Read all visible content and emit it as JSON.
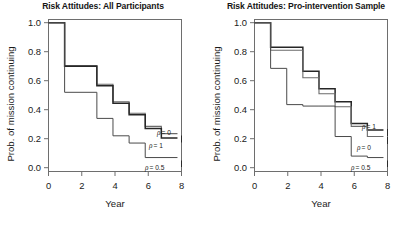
{
  "figure": {
    "width": 412,
    "height": 226,
    "background": "#ffffff",
    "line_color_dark": "#262626",
    "line_color_mid": "#6b6b6b",
    "line_color_light": "#9a9a9a",
    "axis_color": "#6e6e6e"
  },
  "panels": [
    {
      "id": "all-participants",
      "title": "Risk Attitudes: All Participants",
      "xlabel": "Year",
      "ylabel": "Prob. of mission continuing",
      "xticks": [
        "0",
        "2",
        "4",
        "6",
        "8"
      ],
      "yticks": [
        "0.0",
        "0.2",
        "0.4",
        "0.6",
        "0.8",
        "1.0"
      ],
      "curve_labels": [
        {
          "rho": "ρ",
          "eq": " = 0",
          "full": "ρ = 0"
        },
        {
          "rho": "ρ",
          "eq": " = 1",
          "full": "ρ = 1"
        },
        {
          "rho": "ρ",
          "eq": " = 0.5",
          "full": "ρ = 0.5"
        }
      ]
    },
    {
      "id": "pro-intervention-sample",
      "title": "Risk Attitudes: Pro-intervention Sample",
      "xlabel": "Year",
      "ylabel": "Prob. of mission continuing",
      "xticks": [
        "0",
        "2",
        "4",
        "6",
        "8"
      ],
      "yticks": [
        "0.0",
        "0.2",
        "0.4",
        "0.6",
        "0.8",
        "1.0"
      ],
      "curve_labels": [
        {
          "rho": "ρ",
          "eq": " = 1",
          "full": "ρ = 1"
        },
        {
          "rho": "ρ",
          "eq": " = 0",
          "full": "ρ = 0"
        },
        {
          "rho": "ρ",
          "eq": " = 0.5",
          "full": "ρ = 0.5"
        }
      ]
    }
  ],
  "chart_data": [
    {
      "type": "line",
      "subtype": "step-survival",
      "title": "Risk Attitudes: All Participants",
      "xlabel": "Year",
      "ylabel": "Prob. of mission continuing",
      "xlim": [
        0,
        8.25
      ],
      "ylim": [
        0,
        1.02
      ],
      "xticks": [
        0,
        2,
        4,
        6,
        8
      ],
      "yticks": [
        0.0,
        0.2,
        0.4,
        0.6,
        0.8,
        1.0
      ],
      "grid": false,
      "legend": "inline-right-labels",
      "series": [
        {
          "name": "ρ = 0",
          "label": "ρ = 0",
          "color": "#6b6b6b",
          "width": 1.1,
          "x": [
            0,
            1,
            1,
            3,
            3,
            4,
            4,
            5,
            5,
            6,
            6,
            7,
            7,
            8
          ],
          "y": [
            1.0,
            1.0,
            0.705,
            0.705,
            0.575,
            0.575,
            0.455,
            0.455,
            0.375,
            0.375,
            0.285,
            0.285,
            0.235,
            0.235
          ],
          "steps": [
            {
              "year": 0,
              "prob": 1.0
            },
            {
              "year": 1,
              "prob": 0.705
            },
            {
              "year": 3,
              "prob": 0.575
            },
            {
              "year": 4,
              "prob": 0.455
            },
            {
              "year": 5,
              "prob": 0.375
            },
            {
              "year": 6,
              "prob": 0.285
            },
            {
              "year": 7,
              "prob": 0.235
            }
          ]
        },
        {
          "name": "ρ = 1",
          "label": "ρ = 1",
          "color": "#262626",
          "width": 1.5,
          "x": [
            0,
            1,
            1,
            3,
            3,
            4,
            4,
            5,
            5,
            6,
            6,
            7,
            7,
            8
          ],
          "y": [
            1.0,
            1.0,
            0.7,
            0.7,
            0.565,
            0.565,
            0.445,
            0.445,
            0.365,
            0.365,
            0.27,
            0.27,
            0.205,
            0.205
          ],
          "steps": [
            {
              "year": 0,
              "prob": 1.0
            },
            {
              "year": 1,
              "prob": 0.7
            },
            {
              "year": 3,
              "prob": 0.565
            },
            {
              "year": 4,
              "prob": 0.445
            },
            {
              "year": 5,
              "prob": 0.365
            },
            {
              "year": 6,
              "prob": 0.27
            },
            {
              "year": 7,
              "prob": 0.205
            }
          ]
        },
        {
          "name": "ρ = 0.5",
          "label": "ρ = 0.5",
          "color": "#4a4a4a",
          "width": 1.0,
          "x": [
            0,
            1,
            1,
            3,
            3,
            4,
            4,
            5,
            5,
            6,
            6,
            8
          ],
          "y": [
            1.0,
            1.0,
            0.52,
            0.52,
            0.34,
            0.34,
            0.22,
            0.22,
            0.17,
            0.17,
            0.07,
            0.07
          ],
          "steps": [
            {
              "year": 0,
              "prob": 1.0
            },
            {
              "year": 1,
              "prob": 0.52
            },
            {
              "year": 3,
              "prob": 0.34
            },
            {
              "year": 4,
              "prob": 0.22
            },
            {
              "year": 5,
              "prob": 0.17
            },
            {
              "year": 6,
              "prob": 0.07
            }
          ]
        }
      ]
    },
    {
      "type": "line",
      "subtype": "step-survival",
      "title": "Risk Attitudes: Pro-intervention Sample",
      "xlabel": "Year",
      "ylabel": "Prob. of mission continuing",
      "xlim": [
        0,
        8.25
      ],
      "ylim": [
        0,
        1.02
      ],
      "xticks": [
        0,
        2,
        4,
        6,
        8
      ],
      "yticks": [
        0.0,
        0.2,
        0.4,
        0.6,
        0.8,
        1.0
      ],
      "grid": false,
      "legend": "inline-right-labels",
      "series": [
        {
          "name": "ρ = 1",
          "label": "ρ = 1",
          "color": "#262626",
          "width": 1.5,
          "x": [
            0,
            1,
            1,
            2,
            2,
            3,
            3,
            4,
            4,
            5,
            5,
            6,
            6,
            7,
            7,
            8
          ],
          "y": [
            1.0,
            1.0,
            0.83,
            0.83,
            0.83,
            0.83,
            0.665,
            0.665,
            0.545,
            0.545,
            0.455,
            0.455,
            0.305,
            0.305,
            0.26,
            0.26
          ],
          "steps": [
            {
              "year": 0,
              "prob": 1.0
            },
            {
              "year": 1,
              "prob": 0.83
            },
            {
              "year": 3,
              "prob": 0.665
            },
            {
              "year": 4,
              "prob": 0.545
            },
            {
              "year": 5,
              "prob": 0.455
            },
            {
              "year": 6,
              "prob": 0.305
            },
            {
              "year": 7,
              "prob": 0.26
            }
          ]
        },
        {
          "name": "ρ = 0",
          "label": "ρ = 0",
          "color": "#6b6b6b",
          "width": 1.1,
          "x": [
            0,
            1,
            1,
            3,
            3,
            4,
            4,
            5,
            5,
            6,
            6,
            7,
            7,
            8
          ],
          "y": [
            1.0,
            1.0,
            0.81,
            0.81,
            0.62,
            0.62,
            0.51,
            0.51,
            0.42,
            0.42,
            0.285,
            0.285,
            0.215,
            0.215
          ],
          "steps": [
            {
              "year": 0,
              "prob": 1.0
            },
            {
              "year": 1,
              "prob": 0.81
            },
            {
              "year": 3,
              "prob": 0.62
            },
            {
              "year": 4,
              "prob": 0.51
            },
            {
              "year": 5,
              "prob": 0.42
            },
            {
              "year": 6,
              "prob": 0.285
            },
            {
              "year": 7,
              "prob": 0.215
            }
          ]
        },
        {
          "name": "ρ = 0.5",
          "label": "ρ = 0.5",
          "color": "#4a4a4a",
          "width": 1.0,
          "x": [
            0,
            1,
            1,
            2,
            2,
            3,
            3,
            4,
            4,
            5,
            5,
            6,
            6,
            7,
            7,
            8
          ],
          "y": [
            1.0,
            1.0,
            0.685,
            0.685,
            0.435,
            0.435,
            0.425,
            0.425,
            0.425,
            0.425,
            0.215,
            0.215,
            0.08,
            0.08,
            0.07,
            0.07
          ],
          "steps": [
            {
              "year": 0,
              "prob": 1.0
            },
            {
              "year": 1,
              "prob": 0.685
            },
            {
              "year": 2,
              "prob": 0.435
            },
            {
              "year": 4,
              "prob": 0.425
            },
            {
              "year": 5,
              "prob": 0.215
            },
            {
              "year": 6,
              "prob": 0.08
            },
            {
              "year": 7,
              "prob": 0.07
            }
          ]
        }
      ]
    }
  ]
}
